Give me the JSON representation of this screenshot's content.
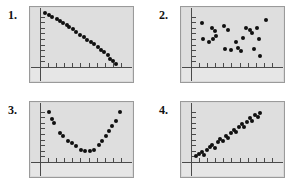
{
  "page": {
    "background_color": "#ffffff",
    "point_color": "#101010",
    "screen_color": "#dedede",
    "axis_color": "#4a4a4a",
    "bezel_color": "#9a9a9a"
  },
  "panels": [
    {
      "label": "1.",
      "name": "panel-1",
      "description": "strong negative linear association",
      "chart": {
        "type": "scatter",
        "title": "",
        "xlabel": "",
        "ylabel": "",
        "xlim": [
          0,
          100
        ],
        "ylim": [
          0,
          100
        ],
        "grid": false,
        "legend": null,
        "axis": {
          "y_ticks": 9,
          "x_ticks": 10
        },
        "points": [
          {
            "x": 6,
            "y": 96
          },
          {
            "x": 10,
            "y": 92
          },
          {
            "x": 14,
            "y": 90
          },
          {
            "x": 19,
            "y": 85
          },
          {
            "x": 23,
            "y": 83
          },
          {
            "x": 26,
            "y": 78
          },
          {
            "x": 30,
            "y": 75
          },
          {
            "x": 33,
            "y": 72
          },
          {
            "x": 37,
            "y": 67
          },
          {
            "x": 41,
            "y": 62
          },
          {
            "x": 45,
            "y": 58
          },
          {
            "x": 49,
            "y": 54
          },
          {
            "x": 53,
            "y": 49
          },
          {
            "x": 57,
            "y": 45
          },
          {
            "x": 61,
            "y": 41
          },
          {
            "x": 65,
            "y": 36
          },
          {
            "x": 69,
            "y": 31
          },
          {
            "x": 72,
            "y": 26
          },
          {
            "x": 76,
            "y": 21
          },
          {
            "x": 79,
            "y": 15
          },
          {
            "x": 82,
            "y": 10
          },
          {
            "x": 85,
            "y": 6
          }
        ]
      }
    },
    {
      "label": "2.",
      "name": "panel-2",
      "description": "no association, random scatter",
      "chart": {
        "type": "scatter",
        "title": "",
        "xlabel": "",
        "ylabel": "",
        "xlim": [
          0,
          100
        ],
        "ylim": [
          0,
          100
        ],
        "grid": false,
        "legend": null,
        "axis": {
          "y_ticks": 9,
          "x_ticks": 10
        },
        "points": [
          {
            "x": 12,
            "y": 78
          },
          {
            "x": 24,
            "y": 70
          },
          {
            "x": 27,
            "y": 64
          },
          {
            "x": 14,
            "y": 50
          },
          {
            "x": 20,
            "y": 44
          },
          {
            "x": 25,
            "y": 50
          },
          {
            "x": 28,
            "y": 55
          },
          {
            "x": 37,
            "y": 74
          },
          {
            "x": 42,
            "y": 66
          },
          {
            "x": 38,
            "y": 33
          },
          {
            "x": 45,
            "y": 30
          },
          {
            "x": 50,
            "y": 44
          },
          {
            "x": 53,
            "y": 34
          },
          {
            "x": 56,
            "y": 28
          },
          {
            "x": 58,
            "y": 52
          },
          {
            "x": 62,
            "y": 70
          },
          {
            "x": 66,
            "y": 66
          },
          {
            "x": 69,
            "y": 60
          },
          {
            "x": 71,
            "y": 32
          },
          {
            "x": 74,
            "y": 70
          },
          {
            "x": 76,
            "y": 50
          },
          {
            "x": 78,
            "y": 20
          },
          {
            "x": 84,
            "y": 84
          }
        ]
      }
    },
    {
      "label": "3.",
      "name": "panel-3",
      "description": "curvilinear U-shaped association",
      "chart": {
        "type": "scatter",
        "title": "",
        "xlabel": "",
        "ylabel": "",
        "xlim": [
          0,
          100
        ],
        "ylim": [
          0,
          100
        ],
        "grid": false,
        "legend": null,
        "axis": {
          "y_ticks": 9,
          "x_ticks": 10
        },
        "points": [
          {
            "x": 10,
            "y": 90
          },
          {
            "x": 14,
            "y": 76
          },
          {
            "x": 16,
            "y": 70
          },
          {
            "x": 22,
            "y": 52
          },
          {
            "x": 26,
            "y": 47
          },
          {
            "x": 31,
            "y": 38
          },
          {
            "x": 36,
            "y": 34
          },
          {
            "x": 41,
            "y": 28
          },
          {
            "x": 46,
            "y": 22
          },
          {
            "x": 51,
            "y": 19
          },
          {
            "x": 56,
            "y": 19
          },
          {
            "x": 61,
            "y": 22
          },
          {
            "x": 66,
            "y": 30
          },
          {
            "x": 70,
            "y": 38
          },
          {
            "x": 74,
            "y": 47
          },
          {
            "x": 78,
            "y": 56
          },
          {
            "x": 81,
            "y": 64
          },
          {
            "x": 85,
            "y": 74
          },
          {
            "x": 90,
            "y": 90
          }
        ]
      }
    },
    {
      "label": "4.",
      "name": "panel-4",
      "description": "strong positive linear association",
      "chart": {
        "type": "scatter",
        "title": "",
        "xlabel": "",
        "ylabel": "",
        "xlim": [
          0,
          100
        ],
        "ylim": [
          0,
          100
        ],
        "grid": false,
        "legend": null,
        "axis": {
          "y_ticks": 9,
          "x_ticks": 10
        },
        "points": [
          {
            "x": 6,
            "y": 10
          },
          {
            "x": 9,
            "y": 14
          },
          {
            "x": 12,
            "y": 17
          },
          {
            "x": 15,
            "y": 13
          },
          {
            "x": 18,
            "y": 22
          },
          {
            "x": 21,
            "y": 26
          },
          {
            "x": 24,
            "y": 30
          },
          {
            "x": 27,
            "y": 25
          },
          {
            "x": 30,
            "y": 35
          },
          {
            "x": 33,
            "y": 41
          },
          {
            "x": 36,
            "y": 37
          },
          {
            "x": 39,
            "y": 46
          },
          {
            "x": 42,
            "y": 42
          },
          {
            "x": 45,
            "y": 51
          },
          {
            "x": 48,
            "y": 57
          },
          {
            "x": 51,
            "y": 53
          },
          {
            "x": 54,
            "y": 62
          },
          {
            "x": 57,
            "y": 67
          },
          {
            "x": 60,
            "y": 63
          },
          {
            "x": 63,
            "y": 72
          },
          {
            "x": 66,
            "y": 78
          },
          {
            "x": 69,
            "y": 74
          },
          {
            "x": 72,
            "y": 84
          },
          {
            "x": 75,
            "y": 80
          },
          {
            "x": 78,
            "y": 88
          }
        ]
      }
    }
  ]
}
